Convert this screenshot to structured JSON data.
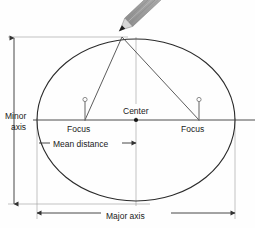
{
  "diagram": {
    "labels": {
      "minor_axis_line1": "Minor",
      "minor_axis_line2": "axis",
      "major_axis": "Major axis",
      "center": "Center",
      "focus_left": "Focus",
      "focus_right": "Focus",
      "mean_distance": "Mean distance"
    },
    "colors": {
      "background": "#fefefe",
      "ink": "#1a1a1a",
      "line": "#333333",
      "thin_line": "#555555",
      "pencil_body": "#b8b8b8",
      "pencil_stripe": "#8d8d8d",
      "pencil_tip_wood": "#d8d8d8",
      "pencil_lead": "#1c1c1c",
      "pin_shaft": "#777777"
    },
    "geometry": {
      "ellipse_center_x": 136,
      "ellipse_center_y": 120,
      "ellipse_rx": 99,
      "ellipse_ry": 81,
      "focus_left_x": 85,
      "focus_right_x": 199,
      "focus_y": 120,
      "pencil_tip_x": 122,
      "pencil_tip_y": 37,
      "minor_axis_dim_x": 14,
      "minor_axis_top_y": 38,
      "minor_axis_bottom_y": 204,
      "major_axis_dim_y": 213,
      "major_axis_left_x": 37,
      "major_axis_right_x": 235,
      "mean_distance_y": 143,
      "mean_distance_left_x": 39,
      "mean_distance_right_x": 136
    }
  }
}
